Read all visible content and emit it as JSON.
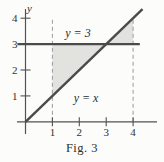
{
  "colors": {
    "line": "#4b4b4b",
    "axis": "#525252",
    "dashed": "#9b9b9b",
    "shade": "#e2e2df",
    "text": "#333333",
    "background": "#fcfcfa"
  },
  "chart_data": {
    "type": "line",
    "title": "Fig. 3",
    "xlabel": "",
    "ylabel": "y",
    "xlim": [
      -0.3,
      4.9
    ],
    "ylim": [
      -0.5,
      4.4
    ],
    "x_ticks": [
      1,
      2,
      3,
      4
    ],
    "y_ticks": [
      1,
      2,
      3,
      4
    ],
    "grid": false,
    "legend_position": "none",
    "series": [
      {
        "name": "y = 3",
        "equation": "y = 3",
        "x": [
          -0.3,
          4.25
        ],
        "y": [
          3,
          3
        ]
      },
      {
        "name": "y = x",
        "equation": "y = x",
        "x": [
          0,
          4.35
        ],
        "y": [
          0,
          4.35
        ]
      }
    ],
    "dashed_vlines": [
      {
        "x": 1,
        "y0": 0,
        "y1": 3.95
      },
      {
        "x": 4,
        "y0": 0,
        "y1": 3.95
      }
    ],
    "shaded_regions": [
      {
        "vertices": [
          [
            1,
            1
          ],
          [
            1,
            3
          ],
          [
            3,
            3
          ]
        ],
        "description": "region between y = x and y = 3 for 1 <= x <= 3"
      },
      {
        "vertices": [
          [
            3,
            3
          ],
          [
            4,
            4
          ],
          [
            4,
            3
          ]
        ],
        "description": "region between y = x and y = 3 for 3 <= x <= 4"
      }
    ],
    "annotations": [
      {
        "text": "y = 3",
        "x": 2.0,
        "y": 3.4
      },
      {
        "text": "y = x",
        "x": 2.25,
        "y": 0.9
      }
    ]
  }
}
